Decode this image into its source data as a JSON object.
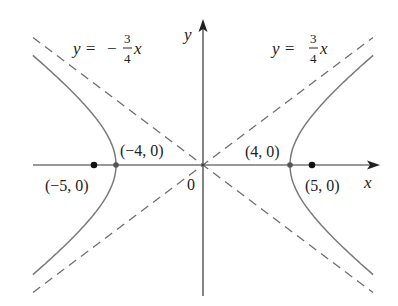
{
  "figure": {
    "type": "hyperbola",
    "equation": "x^2/16 - y^2/9 = 1",
    "a": 4,
    "b": 3,
    "c": 5,
    "x_range": [
      -7.85,
      7.85
    ],
    "y_range": [
      -6.0,
      6.7
    ],
    "colors": {
      "axes": "#333333",
      "curve": "#7a7a7a",
      "asymptote": "#6e6e6e",
      "points": "#111111"
    }
  },
  "axes": {
    "x_label": "x",
    "y_label": "y",
    "origin_label": "0"
  },
  "asymptotes": [
    {
      "slope": 0.75,
      "label_lhs": "y =",
      "num": "3",
      "den": "4",
      "var": "x",
      "sign": ""
    },
    {
      "slope": -0.75,
      "label_lhs": "y =",
      "num": "3",
      "den": "4",
      "var": "x",
      "sign": "−"
    }
  ],
  "points": [
    {
      "x": -5,
      "y": 0,
      "label": "(−5, 0)",
      "kind": "focus"
    },
    {
      "x": -4,
      "y": 0,
      "label": "(−4, 0)",
      "kind": "vertex"
    },
    {
      "x": 4,
      "y": 0,
      "label": "(4, 0)",
      "kind": "vertex"
    },
    {
      "x": 5,
      "y": 0,
      "label": "(5, 0)",
      "kind": "focus"
    }
  ]
}
